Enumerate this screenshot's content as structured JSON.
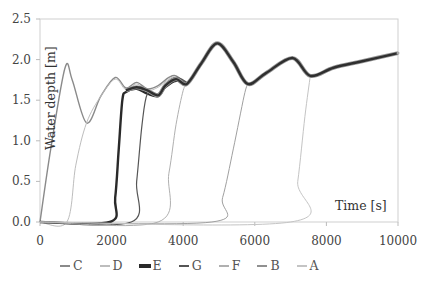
{
  "chart_data": {
    "type": "line",
    "title": "",
    "xlabel": "Time [s]",
    "ylabel": "Water depth [m]",
    "xlim": [
      0,
      10000
    ],
    "ylim": [
      0,
      2.5
    ],
    "xticks": [
      0,
      2000,
      4000,
      6000,
      8000,
      10000
    ],
    "yticks": [
      0.0,
      0.5,
      1.0,
      1.5,
      2.0,
      2.5
    ],
    "ytick_labels": [
      "0.0",
      "0.5",
      "1.0",
      "1.5",
      "2.0",
      "2.5"
    ],
    "grid": false,
    "legend_position": "bottom",
    "common_envelope": {
      "x": [
        2400,
        2700,
        3000,
        3300,
        3500,
        3800,
        4100,
        4500,
        4950,
        5400,
        5800,
        6300,
        7050,
        7550,
        8200,
        9000,
        10000
      ],
      "y": [
        1.62,
        1.66,
        1.62,
        1.56,
        1.68,
        1.76,
        1.7,
        1.95,
        2.2,
        1.97,
        1.7,
        1.83,
        2.02,
        1.8,
        1.9,
        1.98,
        2.08
      ]
    },
    "series": [
      {
        "name": "C",
        "color": "#8a8a8a",
        "width": 1.4,
        "x": [
          0,
          300,
          700,
          900,
          1300,
          1700,
          2100,
          2400,
          2700,
          3000,
          3300,
          3600,
          3800,
          4100
        ],
        "y": [
          0.0,
          0.9,
          1.9,
          1.75,
          1.22,
          1.55,
          1.78,
          1.65,
          1.72,
          1.64,
          1.68,
          1.78,
          1.8,
          1.7
        ]
      },
      {
        "name": "D",
        "color": "#bdbdbd",
        "width": 1.0,
        "x": [
          0,
          750,
          1000,
          1300,
          1700,
          2100,
          2400,
          2700,
          3000,
          3300,
          3600,
          3800,
          4100
        ],
        "y": [
          0.0,
          0.0,
          0.7,
          1.22,
          1.55,
          1.76,
          1.63,
          1.7,
          1.62,
          1.66,
          1.76,
          1.78,
          1.68
        ]
      },
      {
        "name": "E",
        "color": "#2a2a2a",
        "width": 2.4,
        "x": [
          0,
          1950,
          2100,
          2200,
          2300,
          2400,
          2700,
          3000,
          3300,
          3500,
          3800,
          4100
        ],
        "y": [
          0.0,
          0.0,
          0.3,
          0.9,
          1.5,
          1.6,
          1.64,
          1.58,
          1.55,
          1.66,
          1.74,
          1.7
        ]
      },
      {
        "name": "G",
        "color": "#555555",
        "width": 1.2,
        "x": [
          0,
          2550,
          2700,
          2850,
          3000,
          3300,
          3500,
          3800,
          4100
        ],
        "y": [
          0.0,
          0.0,
          0.5,
          1.2,
          1.58,
          1.58,
          1.7,
          1.78,
          1.72
        ]
      },
      {
        "name": "F",
        "color": "#b0b0b0",
        "width": 1.0,
        "x": [
          0,
          3300,
          3600,
          3800,
          4000,
          4100
        ],
        "y": [
          0.0,
          0.0,
          0.6,
          1.2,
          1.62,
          1.68
        ]
      },
      {
        "name": "B",
        "color": "#a0a0a0",
        "width": 1.0,
        "x": [
          0,
          4800,
          5100,
          5400,
          5700,
          5800
        ],
        "y": [
          0.0,
          0.0,
          0.3,
          0.9,
          1.55,
          1.7
        ]
      },
      {
        "name": "A",
        "color": "#c4c4c4",
        "width": 1.0,
        "x": [
          0,
          7000,
          7200,
          7400,
          7550
        ],
        "y": [
          0.0,
          0.0,
          0.5,
          1.3,
          1.8
        ]
      }
    ]
  },
  "legend": [
    {
      "label": "C",
      "color": "#8a8a8a",
      "marker": "line"
    },
    {
      "label": "D",
      "color": "#bdbdbd",
      "marker": "line"
    },
    {
      "label": "E",
      "color": "#2a2a2a",
      "marker": "dot-line"
    },
    {
      "label": "G",
      "color": "#555555",
      "marker": "line"
    },
    {
      "label": "F",
      "color": "#b0b0b0",
      "marker": "line"
    },
    {
      "label": "B",
      "color": "#909090",
      "marker": "line"
    },
    {
      "label": "A",
      "color": "#c4c4c4",
      "marker": "line"
    }
  ]
}
